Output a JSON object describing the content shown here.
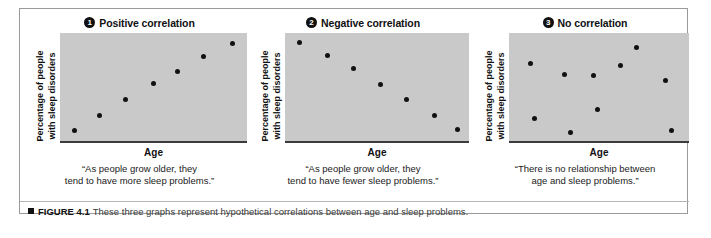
{
  "figure": {
    "caption_bullet": "black-square",
    "caption_label": "FIGURE 4.1",
    "caption_text": "These three graphs represent hypothetical correlations between age and sleep problems."
  },
  "colors": {
    "plot_background": "#c9c9c9",
    "point": "#111111",
    "axis": "#3b3b3b",
    "border": "#9a9a9a"
  },
  "panels": [
    {
      "badge": "1",
      "title": "Positive correlation",
      "ylabel_line1": "Percentage of people",
      "ylabel_line2": "with sleep disorders",
      "xlabel": "Age",
      "quote_line1": "“As people grow older, they",
      "quote_line2": "tend to have more sleep problems.”"
    },
    {
      "badge": "2",
      "title": "Negative correlation",
      "ylabel_line1": "Percentage of people",
      "ylabel_line2": "with sleep disorders",
      "xlabel": "Age",
      "quote_line1": "“As people grow older, they",
      "quote_line2": "tend to have fewer sleep problems.”"
    },
    {
      "badge": "3",
      "title": "No correlation",
      "ylabel_line1": "Percentage of people",
      "ylabel_line2": "with sleep disorders",
      "xlabel": "Age",
      "quote_line1": "“There is no relationship between",
      "quote_line2": "age and sleep problems.”"
    }
  ],
  "chart_data": [
    {
      "type": "scatter",
      "title": "Positive correlation",
      "xlabel": "Age",
      "ylabel": "Percentage of people with sleep disorders",
      "xlim": [
        0,
        100
      ],
      "ylim": [
        0,
        100
      ],
      "grid": false,
      "legend": null,
      "annotation": "“As people grow older, they tend to have more sleep problems.”",
      "points": [
        {
          "x": 8,
          "y": 10
        },
        {
          "x": 21,
          "y": 24
        },
        {
          "x": 35,
          "y": 38
        },
        {
          "x": 50,
          "y": 53
        },
        {
          "x": 63,
          "y": 64
        },
        {
          "x": 77,
          "y": 78
        },
        {
          "x": 92,
          "y": 90
        }
      ]
    },
    {
      "type": "scatter",
      "title": "Negative correlation",
      "xlabel": "Age",
      "ylabel": "Percentage of people with sleep disorders",
      "xlim": [
        0,
        100
      ],
      "ylim": [
        0,
        100
      ],
      "grid": false,
      "legend": null,
      "annotation": "“As people grow older, they tend to have fewer sleep problems.”",
      "points": [
        {
          "x": 8,
          "y": 91
        },
        {
          "x": 23,
          "y": 79
        },
        {
          "x": 37,
          "y": 67
        },
        {
          "x": 52,
          "y": 52
        },
        {
          "x": 66,
          "y": 38
        },
        {
          "x": 81,
          "y": 24
        },
        {
          "x": 94,
          "y": 11
        }
      ]
    },
    {
      "type": "scatter",
      "title": "No correlation",
      "xlabel": "Age",
      "ylabel": "Percentage of people with sleep disorders",
      "xlim": [
        0,
        100
      ],
      "ylim": [
        0,
        100
      ],
      "grid": false,
      "legend": null,
      "annotation": "“There is no relationship between age and sleep problems.”",
      "points": [
        {
          "x": 12,
          "y": 72
        },
        {
          "x": 31,
          "y": 62
        },
        {
          "x": 14,
          "y": 21
        },
        {
          "x": 34,
          "y": 8
        },
        {
          "x": 47,
          "y": 61
        },
        {
          "x": 49,
          "y": 29
        },
        {
          "x": 62,
          "y": 70
        },
        {
          "x": 71,
          "y": 87
        },
        {
          "x": 87,
          "y": 56
        },
        {
          "x": 90,
          "y": 10
        }
      ]
    }
  ]
}
